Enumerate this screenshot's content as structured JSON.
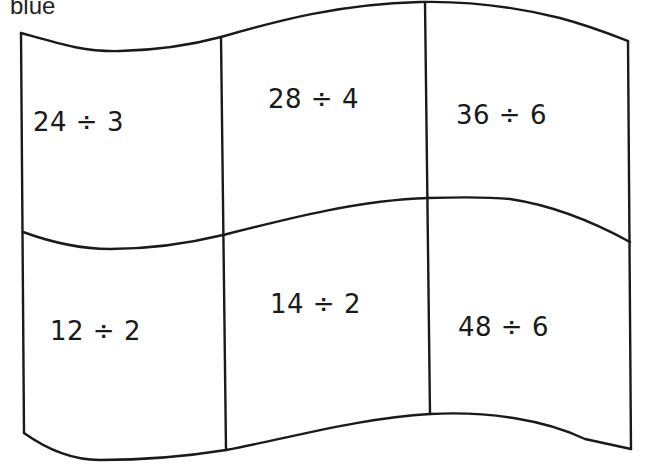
{
  "label": "blue",
  "flag": {
    "rows": 2,
    "cols": 3,
    "stroke_color": "#1a1a1a",
    "cells": [
      {
        "row": 0,
        "col": 0,
        "text": "24 ÷ 3"
      },
      {
        "row": 0,
        "col": 1,
        "text": "28 ÷ 4"
      },
      {
        "row": 0,
        "col": 2,
        "text": "36 ÷ 6"
      },
      {
        "row": 1,
        "col": 0,
        "text": "12 ÷ 2"
      },
      {
        "row": 1,
        "col": 1,
        "text": "14 ÷ 2"
      },
      {
        "row": 1,
        "col": 2,
        "text": "48 ÷ 6"
      }
    ]
  }
}
